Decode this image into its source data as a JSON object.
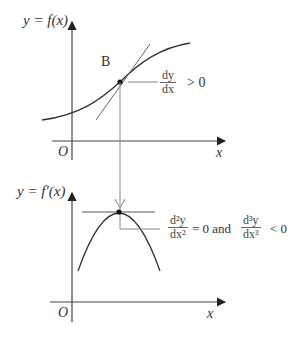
{
  "upper_graph": {
    "y_label": "y = f(x)",
    "point_label": "B",
    "origin_label": "O",
    "x_label": "x",
    "annotation": {
      "numerator": "dy",
      "denominator": "dx",
      "relation": "> 0"
    }
  },
  "lower_graph": {
    "y_label": "y = f′(x)",
    "origin_label": "O",
    "x_label": "x",
    "annotation": {
      "first": {
        "numerator": "d²y",
        "denominator": "dx²",
        "relation": "= 0 and"
      },
      "second": {
        "numerator": "d³y",
        "denominator": "dx³",
        "relation": "< 0"
      }
    }
  },
  "colors": {
    "axis": "#333333",
    "curve": "#333333",
    "guide": "#888888"
  }
}
